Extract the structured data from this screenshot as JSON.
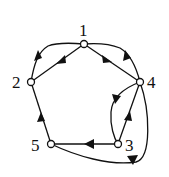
{
  "diagram": {
    "type": "directed-graph",
    "nodes": [
      {
        "id": "1",
        "label": "1",
        "x": 84,
        "y": 44
      },
      {
        "id": "2",
        "label": "2",
        "x": 31,
        "y": 82
      },
      {
        "id": "3",
        "label": "3",
        "x": 118,
        "y": 144
      },
      {
        "id": "4",
        "label": "4",
        "x": 140,
        "y": 82
      },
      {
        "id": "5",
        "label": "5",
        "x": 51,
        "y": 144
      }
    ],
    "edges": [
      {
        "from": "1",
        "to": "2",
        "shape": "straight"
      },
      {
        "from": "2",
        "to": "1",
        "shape": "curved"
      },
      {
        "from": "1",
        "to": "4",
        "shape": "straight"
      },
      {
        "from": "4",
        "to": "1",
        "shape": "curved"
      },
      {
        "from": "4",
        "to": "3",
        "shape": "curved"
      },
      {
        "from": "3",
        "to": "4",
        "shape": "straight"
      },
      {
        "from": "3",
        "to": "5",
        "shape": "straight"
      },
      {
        "from": "5",
        "to": "2",
        "shape": "straight"
      },
      {
        "from": "5",
        "to": "4",
        "shape": "curved"
      }
    ]
  }
}
